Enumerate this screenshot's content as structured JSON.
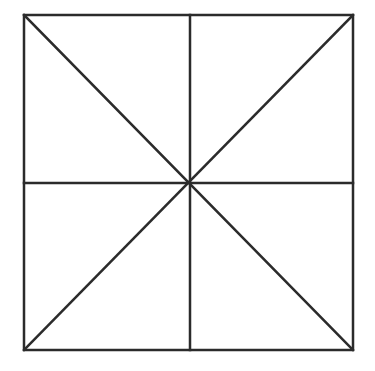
{
  "diagram": {
    "type": "square-with-divisions",
    "square": {
      "x1": 24,
      "y1": 15,
      "x2": 353,
      "y2": 350
    },
    "center": {
      "x": 190,
      "y": 183
    },
    "stroke_color": "#2b2b2b",
    "background_color": "#ffffff",
    "stroke_width": 2.5,
    "lines": [
      {
        "name": "diagonal-top-left-to-bottom-right",
        "x1": 24,
        "y1": 15,
        "x2": 353,
        "y2": 350
      },
      {
        "name": "diagonal-top-right-to-bottom-left",
        "x1": 353,
        "y1": 15,
        "x2": 24,
        "y2": 350
      },
      {
        "name": "vertical-midline",
        "x1": 190,
        "y1": 15,
        "x2": 190,
        "y2": 350
      },
      {
        "name": "horizontal-midline",
        "x1": 24,
        "y1": 183,
        "x2": 353,
        "y2": 183
      }
    ]
  }
}
